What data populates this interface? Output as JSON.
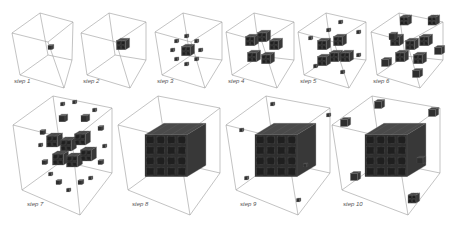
{
  "figure": {
    "background": "#ffffff",
    "box_color": "#9a9a9a",
    "cube_dark": "#2e2e2e",
    "cube_light": "#7a7a7a"
  },
  "panels": [
    {
      "label": "step 1",
      "x": 14,
      "y": 78,
      "box": [
        [
          12,
          33
        ],
        [
          40,
          13
        ],
        [
          73,
          22
        ],
        [
          48,
          42
        ],
        [
          20,
          75
        ],
        [
          64,
          88
        ],
        [
          72,
          60
        ]
      ],
      "cubes": [
        [
          50,
          47,
          4
        ]
      ]
    },
    {
      "label": "step 2",
      "x": 83,
      "y": 78,
      "box": [
        [
          81,
          33
        ],
        [
          109,
          13
        ],
        [
          146,
          22
        ],
        [
          116,
          42
        ],
        [
          87,
          75
        ],
        [
          130,
          88
        ],
        [
          146,
          60
        ]
      ],
      "cubes": [
        [
          121,
          44,
          9
        ]
      ]
    },
    {
      "label": "step 3",
      "x": 157,
      "y": 78,
      "box": [
        [
          155,
          32
        ],
        [
          183,
          13
        ],
        [
          222,
          22
        ],
        [
          191,
          42
        ],
        [
          162,
          75
        ],
        [
          205,
          88
        ],
        [
          222,
          60
        ]
      ],
      "cubes": [
        [
          186,
          50,
          9
        ],
        [
          186,
          36,
          3
        ],
        [
          186,
          64,
          3
        ],
        [
          172,
          50,
          3
        ],
        [
          200,
          50,
          3
        ],
        [
          176,
          41,
          3
        ],
        [
          196,
          59,
          3
        ],
        [
          176,
          59,
          3
        ],
        [
          196,
          41,
          3
        ]
      ]
    },
    {
      "label": "step 4",
      "x": 228,
      "y": 78,
      "box": [
        [
          226,
          32
        ],
        [
          254,
          13
        ],
        [
          294,
          22
        ],
        [
          262,
          42
        ],
        [
          232,
          75
        ],
        [
          277,
          88
        ],
        [
          294,
          60
        ]
      ],
      "cubes": [
        [
          250,
          40,
          9
        ],
        [
          262,
          36,
          9
        ],
        [
          274,
          44,
          9
        ],
        [
          252,
          56,
          9
        ],
        [
          266,
          58,
          9
        ],
        [
          262,
          70,
          0
        ]
      ]
    },
    {
      "label": "step 5",
      "x": 300,
      "y": 78,
      "box": [
        [
          298,
          32
        ],
        [
          326,
          13
        ],
        [
          366,
          22
        ],
        [
          334,
          42
        ],
        [
          304,
          75
        ],
        [
          349,
          88
        ],
        [
          366,
          60
        ]
      ],
      "cubes": [
        [
          322,
          44,
          9
        ],
        [
          338,
          40,
          9
        ],
        [
          334,
          56,
          9
        ],
        [
          322,
          60,
          9
        ],
        [
          345,
          56,
          9
        ],
        [
          310,
          38,
          3
        ],
        [
          358,
          32,
          3
        ],
        [
          340,
          22,
          3
        ],
        [
          315,
          66,
          3
        ],
        [
          358,
          55,
          3
        ],
        [
          342,
          72,
          3
        ],
        [
          328,
          30,
          3
        ]
      ]
    },
    {
      "label": "step 6",
      "x": 373,
      "y": 78,
      "box": [
        [
          371,
          32
        ],
        [
          399,
          13
        ],
        [
          443,
          22
        ],
        [
          407,
          42
        ],
        [
          377,
          75
        ],
        [
          420,
          88
        ],
        [
          443,
          60
        ]
      ],
      "cubes": [
        [
          395,
          40,
          9
        ],
        [
          410,
          44,
          9
        ],
        [
          424,
          40,
          9
        ],
        [
          400,
          56,
          9
        ],
        [
          418,
          58,
          9
        ],
        [
          404,
          20,
          8
        ],
        [
          432,
          20,
          8
        ],
        [
          385,
          62,
          7
        ],
        [
          438,
          50,
          7
        ],
        [
          416,
          73,
          7
        ],
        [
          392,
          36,
          6
        ]
      ]
    },
    {
      "label": "step 7",
      "x": 27,
      "y": 201,
      "box": [
        [
          13,
          125
        ],
        [
          53,
          96
        ],
        [
          112,
          108
        ],
        [
          72,
          140
        ],
        [
          22,
          190
        ],
        [
          80,
          215
        ],
        [
          112,
          173
        ]
      ],
      "cubes": [
        [
          52,
          140,
          11
        ],
        [
          66,
          144,
          11
        ],
        [
          80,
          138,
          11
        ],
        [
          58,
          158,
          11
        ],
        [
          72,
          160,
          11
        ],
        [
          86,
          154,
          11
        ],
        [
          62,
          118,
          6
        ],
        [
          84,
          118,
          6
        ],
        [
          42,
          132,
          4
        ],
        [
          100,
          128,
          4
        ],
        [
          44,
          162,
          4
        ],
        [
          100,
          162,
          4
        ],
        [
          58,
          182,
          4
        ],
        [
          80,
          182,
          4
        ],
        [
          62,
          104,
          3
        ],
        [
          74,
          102,
          3
        ],
        [
          94,
          110,
          3
        ],
        [
          40,
          145,
          3
        ],
        [
          104,
          146,
          3
        ],
        [
          50,
          174,
          3
        ],
        [
          90,
          178,
          3
        ],
        [
          68,
          190,
          3
        ]
      ]
    },
    {
      "label": "step 8",
      "x": 132,
      "y": 201,
      "box": [
        [
          118,
          125
        ],
        [
          158,
          96
        ],
        [
          220,
          108
        ],
        [
          178,
          140
        ],
        [
          128,
          190
        ],
        [
          190,
          215
        ],
        [
          220,
          173
        ]
      ],
      "cubes": [
        [
          166,
          150,
          42
        ]
      ]
    },
    {
      "label": "step 9",
      "x": 240,
      "y": 201,
      "box": [
        [
          226,
          125
        ],
        [
          266,
          96
        ],
        [
          330,
          108
        ],
        [
          286,
          140
        ],
        [
          236,
          190
        ],
        [
          298,
          215
        ],
        [
          330,
          173
        ]
      ],
      "cubes": [
        [
          276,
          150,
          42
        ],
        [
          272,
          104,
          3
        ],
        [
          328,
          115,
          3
        ],
        [
          241,
          130,
          3
        ],
        [
          305,
          165,
          3
        ],
        [
          246,
          178,
          3
        ],
        [
          298,
          200,
          3
        ]
      ]
    },
    {
      "label": "step 10",
      "x": 343,
      "y": 201,
      "box": [
        [
          332,
          125
        ],
        [
          372,
          96
        ],
        [
          440,
          108
        ],
        [
          396,
          140
        ],
        [
          342,
          190
        ],
        [
          408,
          215
        ],
        [
          440,
          173
        ]
      ],
      "cubes": [
        [
          386,
          150,
          42
        ],
        [
          378,
          104,
          7
        ],
        [
          432,
          112,
          7
        ],
        [
          344,
          122,
          7
        ],
        [
          420,
          160,
          6
        ],
        [
          354,
          176,
          7
        ],
        [
          412,
          198,
          8
        ]
      ]
    }
  ]
}
